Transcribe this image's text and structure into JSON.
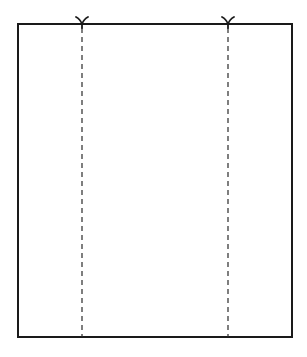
{
  "diagram": {
    "type": "fold-line-sheet",
    "canvas": {
      "width": 307,
      "height": 357,
      "background": "#ffffff"
    },
    "sheet": {
      "x": 18,
      "y": 24,
      "width": 274,
      "height": 313,
      "stroke": "#1a1a1a",
      "stroke_width": 2
    },
    "fold_lines": [
      {
        "x": 82,
        "style": "dashed",
        "stroke": "#2a2a2a",
        "stroke_width": 1.2,
        "dash": "5 4"
      },
      {
        "x": 228,
        "style": "dashed",
        "stroke": "#2a2a2a",
        "stroke_width": 1.2,
        "dash": "5 4"
      }
    ],
    "notch_marks": [
      {
        "x": 82,
        "y": 24,
        "shape": "Y",
        "stroke": "#1a1a1a"
      },
      {
        "x": 228,
        "y": 24,
        "shape": "Y",
        "stroke": "#1a1a1a"
      }
    ]
  }
}
